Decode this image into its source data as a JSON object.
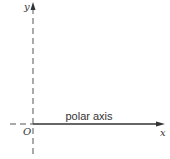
{
  "diagram": {
    "type": "polar-coordinate-axes",
    "labels": {
      "y_axis": "y",
      "x_axis": "x",
      "origin": "O",
      "polar_axis": "polar axis"
    },
    "colors": {
      "line": "#444444",
      "text": "#333333",
      "background": "#ffffff"
    }
  }
}
